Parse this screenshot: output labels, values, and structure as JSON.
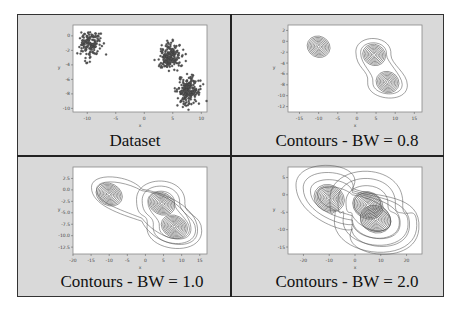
{
  "figure": {
    "background": "#d9d9d9",
    "border_color": "#222222",
    "panels": [
      {
        "caption": "Dataset"
      },
      {
        "caption": "Contours - BW = 0.8"
      },
      {
        "caption": "Contours - BW = 1.0"
      },
      {
        "caption": "Contours - BW = 2.0"
      }
    ]
  },
  "chart_data": [
    {
      "type": "scatter",
      "title": "Dataset",
      "xlabel": "x",
      "ylabel": "y",
      "xlim": [
        -12.5,
        11
      ],
      "ylim": [
        -10.5,
        1.5
      ],
      "xticks": [
        -10,
        -5,
        0,
        5,
        10
      ],
      "yticks": [
        0,
        -2,
        -4,
        -6,
        -8,
        -10
      ],
      "grid": false,
      "series": [
        {
          "name": "cluster_1",
          "center": [
            -9.5,
            -1.2
          ],
          "spread": 0.9,
          "n": 150
        },
        {
          "name": "cluster_2",
          "center": [
            4.5,
            -2.8
          ],
          "spread": 0.9,
          "n": 200
        },
        {
          "name": "cluster_3",
          "center": [
            7.8,
            -7.6
          ],
          "spread": 1.0,
          "n": 200
        }
      ],
      "marker_color": "#555555"
    },
    {
      "type": "contour",
      "title": "Contours - BW = 0.8",
      "xlabel": "x",
      "ylabel": "y",
      "xlim": [
        -18,
        17
      ],
      "ylim": [
        -13,
        3
      ],
      "xticks": [
        -15,
        -10,
        -5,
        0,
        5,
        10,
        15
      ],
      "yticks": [
        2,
        0,
        -2,
        -4,
        -6,
        -8,
        -10,
        -12
      ],
      "bandwidth": 0.8,
      "peaks": [
        [
          -10,
          -1
        ],
        [
          4.5,
          -2.5
        ],
        [
          8,
          -7.5
        ]
      ],
      "levels": 8,
      "grid": false
    },
    {
      "type": "contour",
      "title": "Contours - BW = 1.0",
      "xlabel": "x",
      "ylabel": "y",
      "xlim": [
        -20,
        17
      ],
      "ylim": [
        -14,
        5
      ],
      "xticks": [
        -20,
        -15,
        -10,
        -5,
        0,
        5,
        10,
        15
      ],
      "yticks": [
        2.5,
        0.0,
        -2.5,
        -5.0,
        -7.5,
        -10.0,
        -12.5
      ],
      "bandwidth": 1.0,
      "peaks": [
        [
          -10,
          -1
        ],
        [
          4.5,
          -3
        ],
        [
          8,
          -8
        ]
      ],
      "levels": 9,
      "grid": false
    },
    {
      "type": "contour",
      "title": "Contours - BW = 2.0",
      "xlabel": "x",
      "ylabel": "y",
      "xlim": [
        -26,
        26
      ],
      "ylim": [
        -17,
        8
      ],
      "xticks": [
        -20,
        -10,
        0,
        10,
        20
      ],
      "yticks": [
        5,
        0,
        -5,
        -10,
        -15
      ],
      "bandwidth": 2.0,
      "peaks": [
        [
          -10,
          -1
        ],
        [
          5,
          -3
        ],
        [
          8,
          -7
        ]
      ],
      "levels": 10,
      "grid": false
    }
  ]
}
